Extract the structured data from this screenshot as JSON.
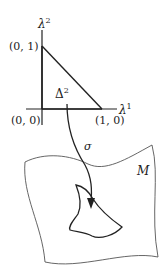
{
  "diagram": {
    "axes": {
      "vertical_label": "λ",
      "vertical_sup": "2",
      "horizontal_label": "λ",
      "horizontal_sup": "1"
    },
    "points": {
      "top": "(0, 1)",
      "origin": "(0, 0)",
      "right": "(1, 0)"
    },
    "simplex": {
      "label": "Δ",
      "sup": "2"
    },
    "map_label": "σ",
    "manifold_label": "M",
    "colors": {
      "ink": "#222222",
      "sheet": "#555555",
      "background": "#ffffff"
    }
  }
}
